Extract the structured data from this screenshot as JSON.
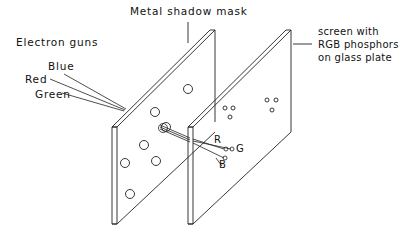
{
  "diagram": {
    "labels": {
      "mask": "Metal shadow mask",
      "guns": "Electron guns",
      "blue": "Blue",
      "red": "Red",
      "green": "Green",
      "screen_line1": "screen with",
      "screen_line2": "RGB phosphors",
      "screen_line3": "on glass plate",
      "r": "R",
      "g": "G",
      "b": "B"
    },
    "colors": {
      "stroke": "#222222",
      "background": "#ffffff"
    }
  }
}
